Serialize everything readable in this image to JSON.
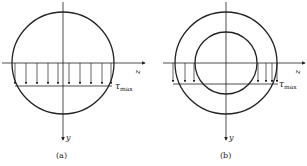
{
  "figures": [
    {
      "id": "a",
      "caption": "(a)",
      "section": "solid circular",
      "axis_z": "z",
      "axis_y": "y",
      "stress_label": "τ",
      "stress_sub": "max"
    },
    {
      "id": "b",
      "caption": "(b)",
      "section": "hollow circular",
      "axis_z": "z",
      "axis_y": "y",
      "stress_label": "τ",
      "stress_sub": "max"
    }
  ],
  "colors": {
    "line": "#222222",
    "background": "#ffffff"
  }
}
